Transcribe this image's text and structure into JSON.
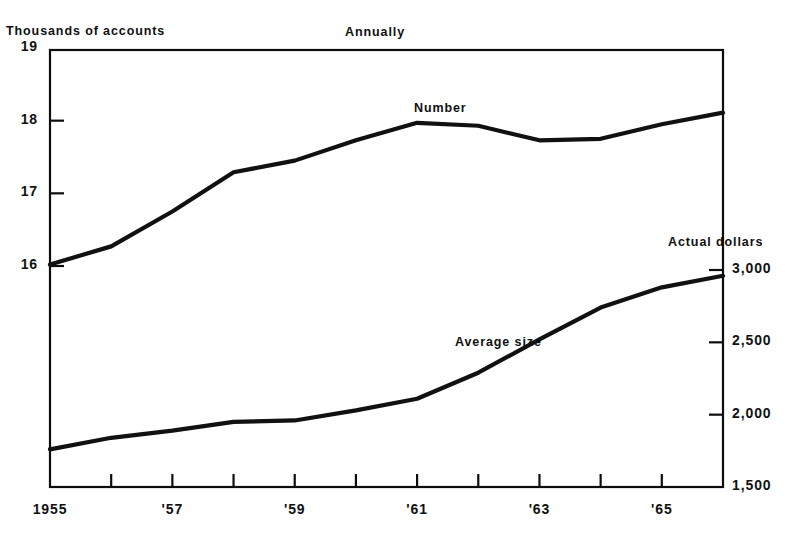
{
  "chart_data": {
    "type": "line",
    "title": "",
    "subtitle": "Annually",
    "x": [
      1955,
      1956,
      1957,
      1958,
      1959,
      1960,
      1961,
      1962,
      1963,
      1964,
      1965,
      1966
    ],
    "xlabel": "",
    "xtick_labels": [
      "1955",
      "'57",
      "'59",
      "'61",
      "'63",
      "'65"
    ],
    "xtick_years": [
      1955,
      1957,
      1959,
      1961,
      1963,
      1965
    ],
    "xlim": [
      1955,
      1966
    ],
    "grid": false,
    "legend": "inline-labels",
    "axes": [
      {
        "id": "left",
        "label": "Thousands of accounts",
        "ylim": [
          16,
          19
        ],
        "ticks": [
          19,
          18,
          17,
          16
        ],
        "tick_labels": [
          "19",
          "18",
          "17",
          "16"
        ]
      },
      {
        "id": "right",
        "label": "Actual dollars",
        "ylim": [
          1500,
          3000
        ],
        "ticks": [
          3000,
          2500,
          2000,
          1500
        ],
        "tick_labels": [
          "3,000",
          "2,500",
          "2,000",
          "1,500"
        ]
      }
    ],
    "series": [
      {
        "name": "Number",
        "axis": "left",
        "units": "thousands of accounts",
        "label_position": {
          "x": 414,
          "y": 101
        },
        "values": [
          16.02,
          16.27,
          16.75,
          17.29,
          17.45,
          17.73,
          17.97,
          17.93,
          17.73,
          17.75,
          17.95,
          18.11
        ]
      },
      {
        "name": "Average size",
        "axis": "right",
        "units": "actual dollars",
        "label_position": {
          "x": 455,
          "y": 335
        },
        "values": [
          1760,
          1840,
          1890,
          1950,
          1960,
          2030,
          2110,
          2290,
          2520,
          2740,
          2880,
          2960
        ]
      }
    ],
    "annotations": [
      {
        "text": "Annually",
        "role": "frequency-note"
      },
      {
        "text": "Thousands of accounts",
        "role": "left-axis-title"
      },
      {
        "text": "Actual dollars",
        "role": "right-axis-title"
      }
    ]
  },
  "labels": {
    "left_axis_title": "Thousands of accounts",
    "right_axis_title": "Actual dollars",
    "period_note": "Annually",
    "series_number": "Number",
    "series_average_size": "Average size"
  }
}
